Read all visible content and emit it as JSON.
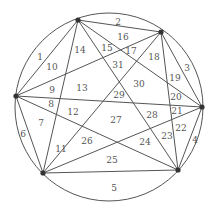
{
  "diagram": {
    "circle": {
      "cx": 109,
      "cy": 107,
      "r": 94
    },
    "colors": {
      "line": "#555555",
      "point": "#333333",
      "label": "#555555"
    },
    "points": [
      {
        "id": "P1",
        "x": 78,
        "y": 20
      },
      {
        "id": "P2",
        "x": 161,
        "y": 32
      },
      {
        "id": "P3",
        "x": 16,
        "y": 96
      },
      {
        "id": "P4",
        "x": 202,
        "y": 107
      },
      {
        "id": "P5",
        "x": 43,
        "y": 173
      },
      {
        "id": "P6",
        "x": 178,
        "y": 170
      }
    ],
    "regions": [
      {
        "label": "1",
        "x": 40,
        "y": 57
      },
      {
        "label": "2",
        "x": 118,
        "y": 22
      },
      {
        "label": "3",
        "x": 187,
        "y": 68
      },
      {
        "label": "4",
        "x": 195,
        "y": 140
      },
      {
        "label": "5",
        "x": 114,
        "y": 188
      },
      {
        "label": "6",
        "x": 23,
        "y": 134
      },
      {
        "label": "7",
        "x": 41,
        "y": 123
      },
      {
        "label": "8",
        "x": 51,
        "y": 104
      },
      {
        "label": "9",
        "x": 52,
        "y": 90
      },
      {
        "label": "10",
        "x": 52,
        "y": 67
      },
      {
        "label": "11",
        "x": 61,
        "y": 149
      },
      {
        "label": "12",
        "x": 73,
        "y": 112
      },
      {
        "label": "13",
        "x": 82,
        "y": 88
      },
      {
        "label": "14",
        "x": 80,
        "y": 50
      },
      {
        "label": "15",
        "x": 107,
        "y": 48
      },
      {
        "label": "16",
        "x": 123,
        "y": 37
      },
      {
        "label": "17",
        "x": 131,
        "y": 51
      },
      {
        "label": "18",
        "x": 154,
        "y": 57
      },
      {
        "label": "19",
        "x": 175,
        "y": 78
      },
      {
        "label": "20",
        "x": 176,
        "y": 97
      },
      {
        "label": "21",
        "x": 177,
        "y": 111
      },
      {
        "label": "22",
        "x": 181,
        "y": 128
      },
      {
        "label": "23",
        "x": 167,
        "y": 136
      },
      {
        "label": "24",
        "x": 145,
        "y": 142
      },
      {
        "label": "25",
        "x": 112,
        "y": 160
      },
      {
        "label": "26",
        "x": 87,
        "y": 141
      },
      {
        "label": "27",
        "x": 116,
        "y": 120
      },
      {
        "label": "28",
        "x": 152,
        "y": 115
      },
      {
        "label": "29",
        "x": 119,
        "y": 95
      },
      {
        "label": "30",
        "x": 139,
        "y": 84
      },
      {
        "label": "31",
        "x": 118,
        "y": 65
      }
    ]
  }
}
